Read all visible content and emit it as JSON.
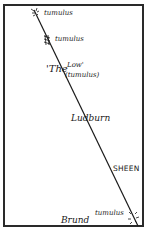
{
  "map": {
    "line_color": "#1a1a1a",
    "labels": {
      "tumulus_top": "tumulus",
      "tumulus_second": "tumulus",
      "the_low_quote_open": "'The",
      "the_low_low": "Low'",
      "the_low_tumulus": "(tumulus)",
      "ludburn": "Ludburn",
      "sheen": "SHEEN",
      "brund": "Brund",
      "tumulus_bottom": "tumulus"
    },
    "markers": [
      {
        "name": "tumulus-top",
        "x": 36,
        "y": 13
      },
      {
        "name": "tumulus-second",
        "x": 47,
        "y": 40
      },
      {
        "name": "tumulus-bottom",
        "x": 134,
        "y": 220
      }
    ]
  }
}
